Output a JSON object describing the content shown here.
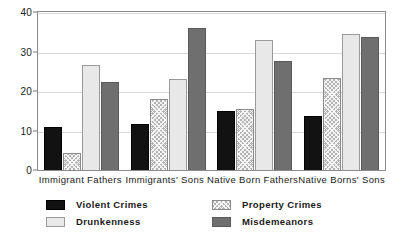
{
  "chart_data": {
    "type": "bar",
    "title": "",
    "subtitle": "",
    "xlabel": "",
    "ylabel": "",
    "ylim": [
      0,
      40
    ],
    "yticks": [
      0,
      10,
      20,
      30,
      40
    ],
    "grid": true,
    "legend_position": "bottom",
    "categories": [
      "Immigrant Fathers",
      "Immigrants' Sons",
      "Native Born Fathers",
      "Native Borns' Sons"
    ],
    "series": [
      {
        "name": "Violent Crimes",
        "color": "#121212",
        "values": [
          11.0,
          11.7,
          15.0,
          13.6
        ]
      },
      {
        "name": "Property Crimes",
        "color": "#b3b3b3",
        "values": [
          4.2,
          18.0,
          15.4,
          23.3
        ]
      },
      {
        "name": "Drunkenness",
        "color": "#e8e8e8",
        "values": [
          26.6,
          23.0,
          33.0,
          34.5
        ]
      },
      {
        "name": "Misdemeanors",
        "color": "#6f6f6f",
        "values": [
          22.4,
          36.0,
          27.7,
          33.6
        ]
      }
    ]
  },
  "legend": {
    "entries": [
      {
        "label": "Violent Crimes"
      },
      {
        "label": "Drunkenness"
      },
      {
        "label": "Property Crimes"
      },
      {
        "label": "Misdemeanors"
      }
    ]
  },
  "page_bleed": {
    "text": ""
  }
}
